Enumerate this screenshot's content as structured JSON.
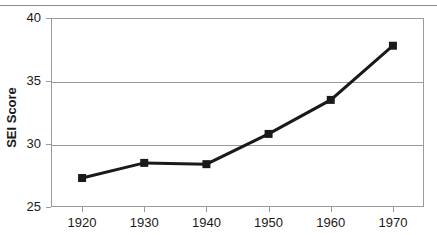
{
  "chart_data": {
    "type": "line",
    "title": "",
    "xlabel": "",
    "ylabel": "SEI Score",
    "x": [
      1920,
      1930,
      1940,
      1950,
      1960,
      1970
    ],
    "xticklabels": [
      "1920",
      "1930",
      "1940",
      "1950",
      "1960",
      "1970"
    ],
    "values": [
      27.3,
      28.5,
      28.4,
      30.8,
      33.5,
      37.8
    ],
    "yticks": [
      25,
      30,
      35,
      40
    ],
    "yticklabels": [
      "25",
      "30",
      "35",
      "40"
    ],
    "ylim": [
      25,
      40
    ],
    "xlim": [
      1915,
      1975
    ],
    "grid": true,
    "legend": false,
    "series_color": "#1a1a1a",
    "marker": "square",
    "gridline_color": "#9a9a9a"
  }
}
